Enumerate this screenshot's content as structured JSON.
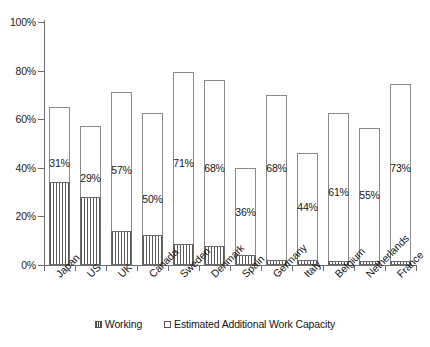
{
  "chart_data": {
    "type": "bar",
    "title": "",
    "subtitle": "",
    "xlabel": "",
    "ylabel": "",
    "ylim": [
      0,
      100
    ],
    "y_unit": "%",
    "grid": false,
    "stacked": true,
    "legend_position": "bottom",
    "y_ticks": [
      "0%",
      "20%",
      "40%",
      "60%",
      "80%",
      "100%"
    ],
    "y_tick_values": [
      0,
      20,
      40,
      60,
      80,
      100
    ],
    "categories": [
      "Japan",
      "US",
      "UK",
      "Canada",
      "Sweden",
      "Denmark",
      "Spain",
      "Germany",
      "Italy",
      "Belgium",
      "Netherlands",
      "France"
    ],
    "series": [
      {
        "name": "Working",
        "values": [
          34,
          28,
          14,
          12.5,
          8.5,
          8,
          4,
          2,
          2,
          1.5,
          1.5,
          1.5
        ]
      },
      {
        "name": "Estimated Additional Work Capacity",
        "values": [
          31,
          29,
          57,
          50,
          71,
          68,
          36,
          68,
          44,
          61,
          55,
          73
        ]
      }
    ],
    "totals": [
      65,
      57,
      71,
      62.5,
      79.5,
      76,
      40,
      70,
      46,
      62.5,
      56.5,
      74.5
    ],
    "data_labels": [
      "31%",
      "29%",
      "57%",
      "50%",
      "71%",
      "68%",
      "36%",
      "68%",
      "44%",
      "61%",
      "55%",
      "73%"
    ],
    "legend": [
      "Working",
      "Estimated Additional Work Capacity"
    ],
    "colors": {
      "working_hatch": "#5a5a5a",
      "capacity_fill": "#ffffff",
      "bar_border": "#8a8a8a",
      "axis": "#6d6d6d",
      "text": "#161616"
    }
  }
}
